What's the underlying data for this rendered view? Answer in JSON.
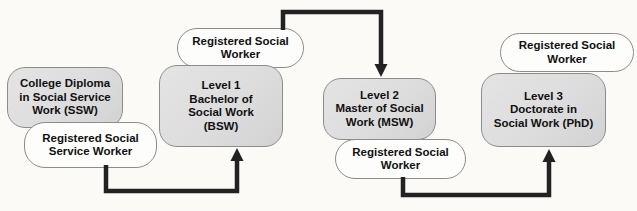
{
  "colors": {
    "background": "#fbfaf7",
    "node_fill": "#dcdcdc",
    "pill_fill": "#fdfdfc",
    "border": "#8c8c8c",
    "arrow": "#222222",
    "text": "#111111"
  },
  "nodes": [
    {
      "id": "college-diploma-ssw",
      "type": "credential",
      "label": "College Diploma\nin Social Service\nWork (SSW)"
    },
    {
      "id": "registered-social-service-worker",
      "type": "registration",
      "label": "Registered Social\nService Worker"
    },
    {
      "id": "registered-social-worker-bsw",
      "type": "registration",
      "label": "Registered Social\nWorker"
    },
    {
      "id": "level1-bsw",
      "type": "credential",
      "label": "Level 1\nBachelor of\nSocial Work\n(BSW)"
    },
    {
      "id": "level2-msw",
      "type": "credential",
      "label": "Level 2\nMaster of Social\nWork (MSW)"
    },
    {
      "id": "registered-social-worker-msw",
      "type": "registration",
      "label": "Registered Social\nWorker"
    },
    {
      "id": "registered-social-worker-phd",
      "type": "registration",
      "label": "Registered Social\nWorker"
    },
    {
      "id": "level3-phd",
      "type": "credential",
      "label": "Level 3\nDoctorate in\nSocial Work (PhD)"
    }
  ],
  "arrows": [
    {
      "from": "registered-social-service-worker",
      "to": "level1-bsw"
    },
    {
      "from": "registered-social-worker-bsw",
      "to": "level2-msw"
    },
    {
      "from": "registered-social-worker-msw",
      "to": "level3-phd"
    }
  ]
}
